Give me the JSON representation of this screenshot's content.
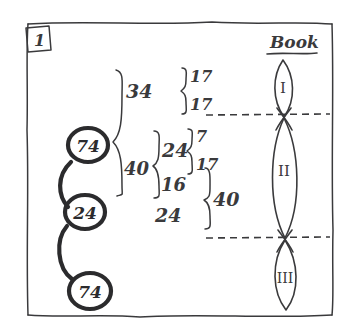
{
  "figure": {
    "corner_label": "1",
    "right_heading": "Book"
  },
  "chain_nodes": [
    {
      "label": "74"
    },
    {
      "label": "24"
    },
    {
      "label": "74"
    }
  ],
  "breakdown": {
    "level1": [
      {
        "label": "34"
      },
      {
        "label": "40"
      }
    ],
    "level2_top": [
      {
        "label": "17"
      },
      {
        "label": "17"
      }
    ],
    "level2_mid_group": {
      "label": "24"
    },
    "level2_mid_children": [
      {
        "label": "7"
      },
      {
        "label": "17"
      }
    ],
    "level2_items": [
      {
        "label": "16"
      },
      {
        "label": "24"
      }
    ],
    "right_total": {
      "label": "40"
    }
  },
  "book_sections": [
    {
      "label": "I"
    },
    {
      "label": "II"
    },
    {
      "label": "III"
    }
  ],
  "colors": {
    "ink": "#3a3a3c",
    "ink_dark": "#2b2b2d",
    "paper": "#ffffff"
  }
}
